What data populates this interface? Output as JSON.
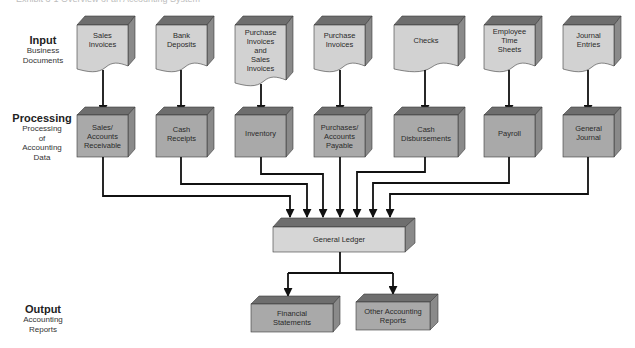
{
  "title": "Exhibit 3-1   Overview of an Accounting System",
  "rows": {
    "input": {
      "heading": "Input",
      "sub": "Business\nDocuments"
    },
    "processing": {
      "heading": "Processing",
      "sub": "Processing\nof\nAccounting\nData"
    },
    "output": {
      "heading": "Output",
      "sub": "Accounting\nReports"
    }
  },
  "documents": [
    {
      "label": "Sales\nInvoices"
    },
    {
      "label": "Bank\nDeposits"
    },
    {
      "label": "Purchase\nInvoices\nand\nSales\nInvoices"
    },
    {
      "label": "Purchase\nInvoices"
    },
    {
      "label": "Checks"
    },
    {
      "label": "Employee\nTime\nSheets"
    },
    {
      "label": "Journal\nEntries"
    }
  ],
  "processes": [
    {
      "label": "Sales/\nAccounts\nReceivable"
    },
    {
      "label": "Cash\nReceipts"
    },
    {
      "label": "Inventory"
    },
    {
      "label": "Purchases/\nAccounts\nPayable"
    },
    {
      "label": "Cash\nDisbursements"
    },
    {
      "label": "Payroll"
    },
    {
      "label": "General\nJournal"
    }
  ],
  "ledger": {
    "label": "General Ledger"
  },
  "outputs": [
    {
      "label": "Financial\nStatements"
    },
    {
      "label": "Other Accounting\nReports"
    }
  ],
  "colors": {
    "document_face": "#d2d2d2",
    "process_face": "#a9a9a9",
    "ledger_face": "#d6d6d6",
    "top_face": "#6e6e6e",
    "side_face": "#8a8a8a",
    "connector": "#111111"
  }
}
